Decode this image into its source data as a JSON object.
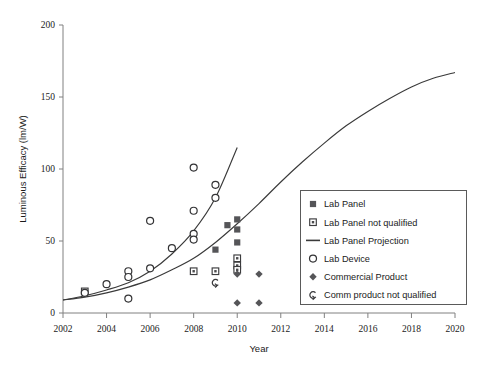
{
  "chart_data": {
    "type": "scatter",
    "title": "",
    "subtitle": "",
    "xlabel": "Year",
    "ylabel": "Luminous Efficacy (lm/W)",
    "xlim": [
      2002,
      2020
    ],
    "ylim": [
      0,
      200
    ],
    "xticks": [
      2002,
      2004,
      2006,
      2008,
      2010,
      2012,
      2014,
      2016,
      2018,
      2020
    ],
    "yticks": [
      0,
      50,
      100,
      150,
      200
    ],
    "xtick_labels": [
      "2002",
      "2004",
      "2006",
      "2008",
      "2010",
      "2012",
      "2014",
      "2016",
      "2018",
      "2020"
    ],
    "ytick_labels": [
      "0",
      "50",
      "100",
      "150",
      "200"
    ],
    "grid": false,
    "legend_position": "center-right",
    "series": [
      {
        "name": "Lab Panel",
        "marker": "filled-square",
        "color": "#555558",
        "points": [
          {
            "x": 2009,
            "y": 44
          },
          {
            "x": 2010,
            "y": 65
          },
          {
            "x": 2010,
            "y": 58
          },
          {
            "x": 2010,
            "y": 49
          },
          {
            "x": 2009.55,
            "y": 61
          }
        ]
      },
      {
        "name": "Lab Panel not qualified",
        "marker": "open-square-dot",
        "color": "#4a4a4c",
        "points": [
          {
            "x": 2003,
            "y": 15
          },
          {
            "x": 2008,
            "y": 29
          },
          {
            "x": 2009,
            "y": 29
          },
          {
            "x": 2010,
            "y": 38
          },
          {
            "x": 2010,
            "y": 33
          },
          {
            "x": 2010,
            "y": 30
          }
        ]
      },
      {
        "name": "Lab Panel Projection",
        "marker": "line",
        "color": "#3a3a3a",
        "curve": [
          {
            "x": 2002,
            "y": 9
          },
          {
            "x": 2003,
            "y": 11
          },
          {
            "x": 2004,
            "y": 14
          },
          {
            "x": 2005,
            "y": 18
          },
          {
            "x": 2006,
            "y": 23
          },
          {
            "x": 2007,
            "y": 30
          },
          {
            "x": 2008,
            "y": 38
          },
          {
            "x": 2009,
            "y": 49
          },
          {
            "x": 2010,
            "y": 62
          },
          {
            "x": 2011,
            "y": 76
          },
          {
            "x": 2012,
            "y": 91
          },
          {
            "x": 2013,
            "y": 105
          },
          {
            "x": 2014,
            "y": 118
          },
          {
            "x": 2015,
            "y": 130
          },
          {
            "x": 2016,
            "y": 140
          },
          {
            "x": 2017,
            "y": 149
          },
          {
            "x": 2018,
            "y": 157
          },
          {
            "x": 2019,
            "y": 163
          },
          {
            "x": 2020,
            "y": 167
          }
        ]
      },
      {
        "name": "Lab Device",
        "marker": "open-circle",
        "color": "#333335",
        "points": [
          {
            "x": 2003,
            "y": 14
          },
          {
            "x": 2004,
            "y": 20
          },
          {
            "x": 2005,
            "y": 29
          },
          {
            "x": 2005,
            "y": 25
          },
          {
            "x": 2005,
            "y": 10
          },
          {
            "x": 2006,
            "y": 64
          },
          {
            "x": 2006,
            "y": 31
          },
          {
            "x": 2007,
            "y": 45
          },
          {
            "x": 2008,
            "y": 101
          },
          {
            "x": 2008,
            "y": 71
          },
          {
            "x": 2008,
            "y": 55
          },
          {
            "x": 2008,
            "y": 51
          },
          {
            "x": 2009,
            "y": 89
          },
          {
            "x": 2009,
            "y": 80
          }
        ],
        "trend_curve": [
          {
            "x": 2002,
            "y": 9
          },
          {
            "x": 2003,
            "y": 12
          },
          {
            "x": 2004,
            "y": 16
          },
          {
            "x": 2005,
            "y": 21
          },
          {
            "x": 2006,
            "y": 29
          },
          {
            "x": 2007,
            "y": 41
          },
          {
            "x": 2008,
            "y": 57
          },
          {
            "x": 2009,
            "y": 80
          },
          {
            "x": 2010,
            "y": 115
          }
        ]
      },
      {
        "name": "Commercial Product",
        "marker": "filled-diamond",
        "color": "#4a4a4c",
        "points": [
          {
            "x": 2010,
            "y": 27
          },
          {
            "x": 2011,
            "y": 27
          },
          {
            "x": 2010,
            "y": 7
          },
          {
            "x": 2011,
            "y": 7
          }
        ]
      },
      {
        "name": "Comm product not qualified",
        "marker": "partial-circle",
        "color": "#3a3a3c",
        "points": [
          {
            "x": 2009,
            "y": 21
          }
        ]
      }
    ],
    "legend_entries": [
      {
        "label": "Lab Panel",
        "marker": "filled-square"
      },
      {
        "label": "Lab Panel not qualified",
        "marker": "open-square-dot"
      },
      {
        "label": "Lab Panel Projection",
        "marker": "line"
      },
      {
        "label": "Lab Device",
        "marker": "open-circle"
      },
      {
        "label": "Commercial Product",
        "marker": "filled-diamond"
      },
      {
        "label": "Comm product not qualified",
        "marker": "partial-circle"
      }
    ]
  }
}
